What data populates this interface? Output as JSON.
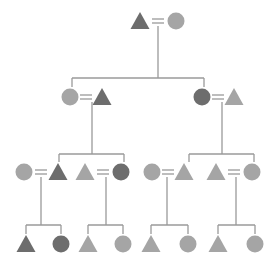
{
  "diagram": {
    "type": "pedigree-chart",
    "colors": {
      "dark": "#6d6d6d",
      "medium": "#858585",
      "light": "#a5a5a5",
      "line": "#9a9a9a",
      "background": "#ffffff"
    },
    "symbols": {
      "triangle": "male-triangle-icon",
      "circle": "female-circle-icon",
      "equals": "marriage-link"
    },
    "generations": [
      {
        "level": 1,
        "couples": [
          {
            "id": "g1",
            "left": {
              "shape": "triangle",
              "shade": "dark"
            },
            "right": {
              "shape": "circle",
              "shade": "light"
            }
          }
        ]
      },
      {
        "level": 2,
        "couples": [
          {
            "id": "g2a",
            "left": {
              "shape": "circle",
              "shade": "light"
            },
            "right": {
              "shape": "triangle",
              "shade": "dark"
            }
          },
          {
            "id": "g2b",
            "left": {
              "shape": "circle",
              "shade": "dark"
            },
            "right": {
              "shape": "triangle",
              "shade": "light"
            }
          }
        ]
      },
      {
        "level": 3,
        "couples": [
          {
            "id": "g3a",
            "left": {
              "shape": "circle",
              "shade": "light"
            },
            "right": {
              "shape": "triangle",
              "shade": "dark"
            }
          },
          {
            "id": "g3b",
            "left": {
              "shape": "triangle",
              "shade": "light"
            },
            "right": {
              "shape": "circle",
              "shade": "dark"
            }
          },
          {
            "id": "g3c",
            "left": {
              "shape": "circle",
              "shade": "light"
            },
            "right": {
              "shape": "triangle",
              "shade": "light"
            }
          },
          {
            "id": "g3d",
            "left": {
              "shape": "triangle",
              "shade": "light"
            },
            "right": {
              "shape": "circle",
              "shade": "light"
            }
          }
        ]
      },
      {
        "level": 4,
        "children": [
          {
            "shape": "triangle",
            "shade": "dark"
          },
          {
            "shape": "circle",
            "shade": "dark"
          },
          {
            "shape": "triangle",
            "shade": "light"
          },
          {
            "shape": "circle",
            "shade": "light"
          },
          {
            "shape": "triangle",
            "shade": "light"
          },
          {
            "shape": "circle",
            "shade": "light"
          },
          {
            "shape": "triangle",
            "shade": "light"
          },
          {
            "shape": "circle",
            "shade": "light"
          }
        ]
      }
    ],
    "caption": ""
  }
}
